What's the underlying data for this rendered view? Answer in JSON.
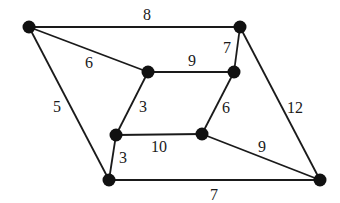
{
  "graph": {
    "type": "weighted-undirected-graph",
    "nodes": [
      {
        "id": "A",
        "x": 29,
        "y": 27
      },
      {
        "id": "B",
        "x": 240,
        "y": 27
      },
      {
        "id": "C",
        "x": 148,
        "y": 72
      },
      {
        "id": "D",
        "x": 234,
        "y": 72
      },
      {
        "id": "E",
        "x": 116,
        "y": 135
      },
      {
        "id": "F",
        "x": 202,
        "y": 134
      },
      {
        "id": "G",
        "x": 109,
        "y": 180
      },
      {
        "id": "H",
        "x": 320,
        "y": 180
      }
    ],
    "edges": [
      {
        "from": "A",
        "to": "B",
        "weight": "8",
        "lx": 147,
        "ly": 14
      },
      {
        "from": "A",
        "to": "C",
        "weight": "6",
        "lx": 89,
        "ly": 62
      },
      {
        "from": "A",
        "to": "G",
        "weight": "5",
        "lx": 57,
        "ly": 106
      },
      {
        "from": "B",
        "to": "D",
        "weight": "7",
        "lx": 227,
        "ly": 47
      },
      {
        "from": "B",
        "to": "H",
        "weight": "12",
        "lx": 295,
        "ly": 107
      },
      {
        "from": "C",
        "to": "D",
        "weight": "9",
        "lx": 192,
        "ly": 60
      },
      {
        "from": "C",
        "to": "E",
        "weight": "3",
        "lx": 143,
        "ly": 106
      },
      {
        "from": "D",
        "to": "F",
        "weight": "6",
        "lx": 226,
        "ly": 107
      },
      {
        "from": "E",
        "to": "F",
        "weight": "10",
        "lx": 159,
        "ly": 146
      },
      {
        "from": "E",
        "to": "G",
        "weight": "3",
        "lx": 123,
        "ly": 157
      },
      {
        "from": "F",
        "to": "H",
        "weight": "9",
        "lx": 262,
        "ly": 146
      },
      {
        "from": "G",
        "to": "H",
        "weight": "7",
        "lx": 214,
        "ly": 194
      }
    ],
    "colors": {
      "edge": "#1a1a1a",
      "node": "#111111",
      "background": "#ffffff"
    }
  }
}
